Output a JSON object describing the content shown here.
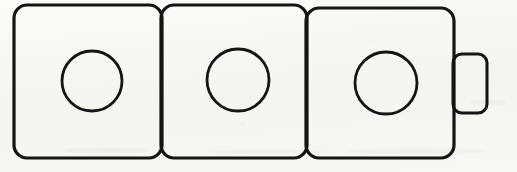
{
  "diagram": {
    "type": "line-art",
    "canvas": {
      "width": 517,
      "height": 172
    },
    "style": {
      "background_color": "#f7f7f4",
      "stroke_color": "#141414",
      "fill_color": "none",
      "stroke_width": 3.2,
      "circle_stroke_width": 2.8
    },
    "cells": [
      {
        "name": "cell-1",
        "label": "",
        "x": 14,
        "y": 5,
        "width": 148,
        "height": 153,
        "corner_radius": 13,
        "hole": {
          "cx": 92,
          "cy": 81,
          "r": 30
        }
      },
      {
        "name": "cell-2",
        "label": "",
        "x": 161,
        "y": 5,
        "width": 146,
        "height": 153,
        "corner_radius": 13,
        "hole": {
          "cx": 238,
          "cy": 80,
          "r": 31
        }
      },
      {
        "name": "cell-3",
        "label": "",
        "x": 306,
        "y": 8,
        "width": 148,
        "height": 150,
        "corner_radius": 13,
        "hole": {
          "cx": 386,
          "cy": 83,
          "r": 31
        }
      }
    ],
    "tab": {
      "name": "side-tab",
      "label": "",
      "x": 453,
      "y": 54,
      "width": 34,
      "height": 59,
      "corner_radius": 9,
      "attached_to": "cell-3",
      "side": "right"
    }
  }
}
